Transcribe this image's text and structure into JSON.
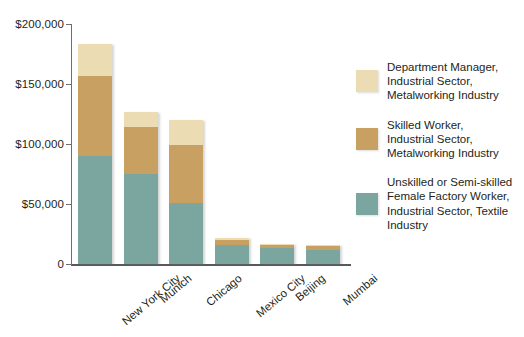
{
  "chart_data": {
    "type": "bar",
    "subtype": "stacked-bar",
    "title": "",
    "xlabel": "",
    "ylabel": "",
    "ylim": [
      0,
      200000
    ],
    "grid": false,
    "legend_position": "right",
    "categories": [
      "New York City",
      "Munich",
      "Chicago",
      "Mexico City",
      "Beijing",
      "Mumbai"
    ],
    "series": [
      {
        "name": "Unskilled or Semi-skilled Female Factory Worker, Industrial Sector, Textile Industry",
        "short_name": "Unskilled or Semi-skilled Female Factory Worker",
        "color": "#7ba6a0",
        "values": [
          90000,
          75000,
          51000,
          16000,
          13000,
          12000
        ]
      },
      {
        "name": "Skilled Worker, Industrial Sector, Metalworking Industry",
        "short_name": "Skilled Worker",
        "color": "#c8a062",
        "values": [
          67000,
          39000,
          48000,
          4000,
          3000,
          3000
        ]
      },
      {
        "name": "Department Manager, Industrial Sector, Metalworking Industry",
        "short_name": "Department Manager",
        "color": "#ecdcb4",
        "values": [
          26000,
          13000,
          21000,
          2000,
          1000,
          1000
        ]
      }
    ],
    "totals": [
      183000,
      127000,
      120000,
      22000,
      17000,
      16000
    ],
    "yticks": [
      0,
      50000,
      100000,
      150000,
      200000
    ],
    "ytick_labels": [
      "0",
      "$50,000",
      "$100,000",
      "$150,000",
      "$200,000"
    ]
  },
  "axis": {
    "ytick_labels": [
      "$200,000",
      "$150,000",
      "$100,000",
      "$50,000",
      "0"
    ]
  },
  "legend": {
    "items": [
      {
        "color": "#ecdcb4",
        "line1": "Department Manager,",
        "line2": "Industrial Sector,",
        "line3": "Metalworking Industry",
        "line4": ""
      },
      {
        "color": "#c8a062",
        "line1": "Skilled Worker,",
        "line2": "Industrial Sector,",
        "line3": "Metalworking Industry",
        "line4": ""
      },
      {
        "color": "#7ba6a0",
        "line1": "Unskilled or Semi-skilled",
        "line2": "Female Factory Worker,",
        "line3": "Industrial Sector, Textile",
        "line4": "Industry"
      }
    ]
  }
}
